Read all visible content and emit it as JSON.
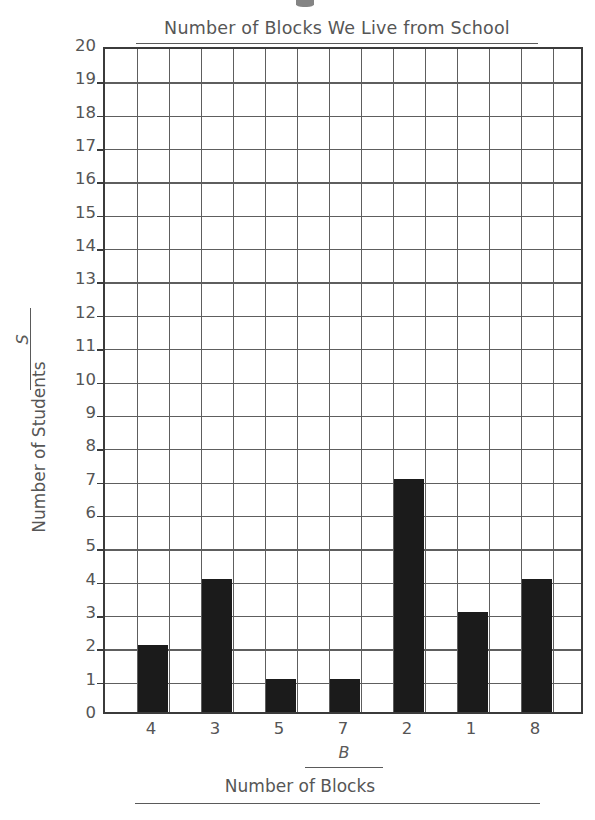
{
  "chart_data": {
    "type": "bar",
    "title": "Number of Blocks We Live from School",
    "xlabel": "Number of Blocks",
    "ylabel": "Number of Students",
    "x_variable": "B",
    "y_variable": "S",
    "categories": [
      "4",
      "3",
      "5",
      "7",
      "2",
      "1",
      "8"
    ],
    "values": [
      2,
      4,
      1,
      1,
      7,
      3,
      4
    ],
    "ylim": [
      0,
      20
    ],
    "y_ticks": [
      "20",
      "19",
      "18",
      "17",
      "16",
      "15",
      "14",
      "13",
      "12",
      "11",
      "10",
      "9",
      "8",
      "7",
      "6",
      "5",
      "4",
      "3",
      "2",
      "1",
      "0"
    ],
    "grid": true,
    "grid_columns": 15,
    "grid_rows": 20,
    "legend": "none",
    "bar_color": "#1b1b1b",
    "grid_color": "#5e5e5e",
    "axis_color": "#3b3b3b",
    "text_color": "#565656"
  }
}
